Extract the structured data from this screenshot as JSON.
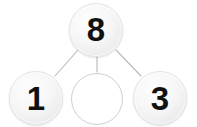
{
  "diagram": {
    "type": "number-bond",
    "background_color": "#ffffff",
    "line_color": "#b9b9b9",
    "node_fill_color": "#f2f2f2",
    "node_border_color": "#e3e3e3",
    "empty_node_border_color": "#cfcfcf",
    "digit_color": "#111111",
    "whole": {
      "label": "8",
      "name": "whole",
      "filled": true
    },
    "parts": [
      {
        "label": "1",
        "name": "part-left",
        "filled": true,
        "is_blank": false
      },
      {
        "label": "",
        "name": "part-middle-blank",
        "filled": false,
        "is_blank": true
      },
      {
        "label": "3",
        "name": "part-right",
        "filled": true,
        "is_blank": false
      }
    ],
    "connectors": [
      {
        "name": "connector-whole-to-left",
        "from": "whole",
        "to": "part-left"
      },
      {
        "name": "connector-whole-to-middle",
        "from": "whole",
        "to": "part-middle-blank"
      },
      {
        "name": "connector-whole-to-right",
        "from": "whole",
        "to": "part-right"
      }
    ]
  }
}
